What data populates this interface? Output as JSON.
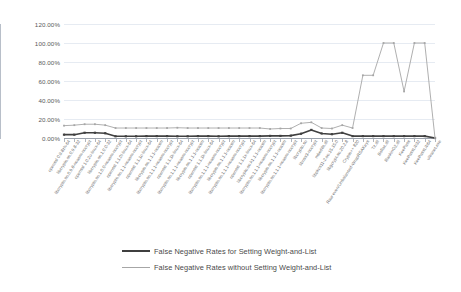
{
  "chart_data": {
    "type": "line",
    "title": "",
    "xlabel": "",
    "ylabel": "",
    "ylim": [
      0,
      1.2
    ],
    "ytick_labels": [
      "120.00%",
      "100.00%",
      "80.00%",
      "60.00%",
      "40.00%",
      "20.00%",
      "0.00%"
    ],
    "ytick_values": [
      1.2,
      1.0,
      0.8,
      0.6,
      0.4,
      0.2,
      0.0
    ],
    "grid": true,
    "legend_position": "bottom",
    "categories": [
      "openssl 0.9.8zh-64",
      "libcrypto.so.0.9.8-32",
      "libcrypto.so.0.9.8-noasm-nocrypt",
      "openssl 1.0.2u-linux-64",
      "libcrypto.so.1.0.0-32",
      "libcrypto.so.1.0.0-noasm-nocrypt",
      "openssl 1.1.0l-linux-64",
      "libcrypto.so.1.1-noasm-nocrypt",
      "openssl 1.1.1c-linux-64",
      "libcrypto.so.1.1.1-noasm",
      "libcrypto.so.1.1.1-noasm-nocrypt",
      "openssl 1.1.1k-linux-64",
      "libcrypto.so.1.1.1-noasm-nocrypt",
      "libcrypto.so.1.1.1-noasm",
      "openssl 1.1.1k-linux-64",
      "libcrypto.so.1.1.1-noasm-nocrypt",
      "libcrypto.so.1.1.1-noasm",
      "libcrypto.so.1.1.1-noasm-nocrypt",
      "openssl 1.1.1x-linux-64",
      "libcrypto.so.k1.1.1-noasm",
      "libcrypto.so.1.1.1-noasm-nocrypt",
      "libcrypto.so.1.1.1-noasm",
      "libcrypto.so.1.1.1-noasm-nocrypt",
      "libcrypto.so",
      "libnss3-nocrypt",
      "mbedtls.dll",
      "libpkcs11-2.so.15.15.0",
      "libgcrypt.so.20.2.8",
      "Crypto++ 820",
      "Raw even/Unbalanced-WrapRSAKeys",
      "Tz.dll",
      "Bsflac.dll",
      "RankinG2.dll",
      "KeePass",
      "KeePassLib32",
      "KeePassLib64",
      "ultranet.exe"
    ],
    "series": [
      {
        "name": "False Negative Rates for Setting Weight-and-List",
        "color": "#404040",
        "marker": "square",
        "values": [
          0.035,
          0.035,
          0.055,
          0.055,
          0.05,
          0.018,
          0.018,
          0.018,
          0.02,
          0.02,
          0.02,
          0.018,
          0.018,
          0.02,
          0.02,
          0.018,
          0.02,
          0.02,
          0.02,
          0.02,
          0.022,
          0.022,
          0.025,
          0.045,
          0.085,
          0.048,
          0.04,
          0.055,
          0.02,
          0.02,
          0.02,
          0.02,
          0.02,
          0.02,
          0.02,
          0.02,
          0.0
        ]
      },
      {
        "name": "False Negative Rates without Setting Weight-and-List",
        "color": "#a6a6a6",
        "marker": "square",
        "values": [
          0.13,
          0.135,
          0.145,
          0.145,
          0.135,
          0.105,
          0.105,
          0.105,
          0.105,
          0.105,
          0.105,
          0.108,
          0.105,
          0.105,
          0.105,
          0.105,
          0.105,
          0.105,
          0.105,
          0.105,
          0.095,
          0.1,
          0.1,
          0.155,
          0.165,
          0.105,
          0.1,
          0.135,
          0.105,
          0.66,
          0.66,
          1.0,
          1.0,
          0.49,
          1.0,
          1.0,
          0.0
        ]
      }
    ]
  },
  "legend": {
    "items": [
      {
        "label": "False Negative Rates for Setting Weight-and-List",
        "color": "#404040",
        "style": "dark"
      },
      {
        "label": "False Negative Rates without Setting Weight-and-List",
        "color": "#a6a6a6",
        "style": "light"
      }
    ]
  }
}
